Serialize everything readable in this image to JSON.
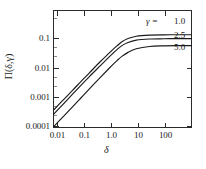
{
  "chart_data": {
    "type": "line",
    "title": "",
    "xlabel": "δ",
    "ylabel": "Π(δ,γ)",
    "xscale": "log",
    "yscale": "log",
    "xlim": [
      0.01,
      1000
    ],
    "ylim": [
      0.0001,
      1
    ],
    "grid": false,
    "legend_position": "upper-right-inside",
    "xticks": [
      "0.01",
      "0.1",
      "1.0",
      "10",
      "100"
    ],
    "xtick_values": [
      0.01,
      0.1,
      1.0,
      10,
      100
    ],
    "yticks": [
      "0.0001",
      "0.001",
      "0.01",
      "0.1"
    ],
    "ytick_values": [
      0.0001,
      0.001,
      0.01,
      0.1
    ],
    "legend_prefix": "γ  =",
    "series": [
      {
        "name": "1.0",
        "label": "1.0",
        "color": "#1a1a1a",
        "x": [
          0.01,
          0.02,
          0.05,
          0.1,
          0.2,
          0.5,
          1.0,
          1.5,
          2.0,
          3.0,
          5.0,
          10,
          30,
          100,
          300,
          1000
        ],
        "values": [
          0.00039,
          0.00078,
          0.0019,
          0.0038,
          0.0074,
          0.018,
          0.034,
          0.049,
          0.062,
          0.085,
          0.11,
          0.132,
          0.144,
          0.147,
          0.148,
          0.148
        ]
      },
      {
        "name": "2.5",
        "label": "2.5",
        "color": "#1a1a1a",
        "x": [
          0.01,
          0.02,
          0.05,
          0.1,
          0.2,
          0.5,
          1.0,
          1.5,
          2.0,
          3.0,
          5.0,
          10,
          30,
          100,
          300,
          1000
        ],
        "values": [
          0.00028,
          0.00056,
          0.0014,
          0.0028,
          0.0055,
          0.013,
          0.025,
          0.036,
          0.046,
          0.063,
          0.081,
          0.097,
          0.106,
          0.108,
          0.109,
          0.109
        ]
      },
      {
        "name": "5.0",
        "label": "5.0",
        "color": "#1a1a1a",
        "x": [
          0.01,
          0.02,
          0.05,
          0.1,
          0.2,
          0.5,
          1.0,
          1.5,
          2.0,
          3.0,
          5.0,
          10,
          30,
          100,
          300,
          1000
        ],
        "values": [
          0.000105,
          0.00021,
          0.00052,
          0.00104,
          0.0021,
          0.0052,
          0.0102,
          0.015,
          0.0194,
          0.027,
          0.037,
          0.049,
          0.059,
          0.062,
          0.063,
          0.063
        ]
      }
    ]
  },
  "axes": {
    "x_title": "δ",
    "y_title": "Π(δ,γ)"
  },
  "legend": {
    "prefix": "γ  =",
    "entries": [
      "1.0",
      "2.5",
      "5.0"
    ]
  },
  "colors": {
    "line": "#1a1a1a",
    "frame": "#2b2b2b",
    "background": "#ffffff",
    "text": "#1a1a1a"
  }
}
